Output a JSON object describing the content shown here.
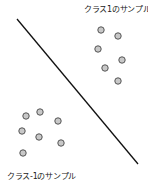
{
  "labels": {
    "class_pos": "クラス1のサンプル",
    "class_neg": "クラス-1のサンプル"
  },
  "colors": {
    "point_fill": "#c8c8c8",
    "point_stroke": "#555555",
    "line": "#111111"
  },
  "boundary": {
    "x1": 17,
    "y1": 19,
    "x2": 138,
    "y2": 164
  },
  "class_pos_points": [
    [
      101,
      30
    ],
    [
      118,
      36
    ],
    [
      98,
      49
    ],
    [
      122,
      60
    ],
    [
      105,
      68
    ],
    [
      118,
      81
    ]
  ],
  "class_neg_points": [
    [
      26,
      116
    ],
    [
      40,
      112
    ],
    [
      58,
      121
    ],
    [
      22,
      131
    ],
    [
      39,
      137
    ],
    [
      61,
      143
    ],
    [
      23,
      153
    ]
  ]
}
